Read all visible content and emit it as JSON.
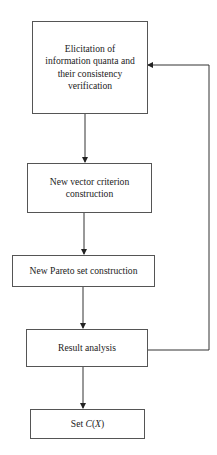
{
  "diagram": {
    "type": "flowchart",
    "nodes": [
      {
        "id": "elicitation",
        "label": "Elicitation of information quanta and their consistency verification"
      },
      {
        "id": "vector",
        "label": "New vector criterion construction"
      },
      {
        "id": "pareto",
        "label": "New Pareto set construction"
      },
      {
        "id": "analysis",
        "label": "Result analysis"
      },
      {
        "id": "result",
        "label_prefix": "Set ",
        "label_italic": "C",
        "label_paren_open": "(",
        "label_italic2": "X",
        "label_paren_close": ")"
      }
    ],
    "edges": [
      {
        "from": "elicitation",
        "to": "vector"
      },
      {
        "from": "vector",
        "to": "pareto"
      },
      {
        "from": "pareto",
        "to": "analysis"
      },
      {
        "from": "analysis",
        "to": "result"
      },
      {
        "from": "analysis",
        "to": "elicitation",
        "kind": "feedback-loop"
      }
    ],
    "colors": {
      "line": "#333333",
      "border": "#555555",
      "background": "#ffffff"
    }
  }
}
